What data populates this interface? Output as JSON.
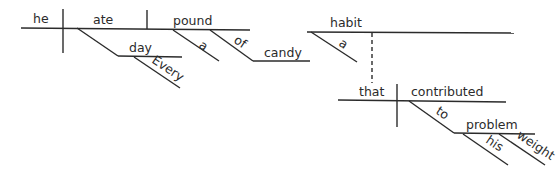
{
  "diagram": {
    "type": "sentence-diagram",
    "sentence_words": {
      "subject": "he",
      "verb": "ate",
      "object": "pound",
      "adverbial_noun": "day",
      "adverbial_modifier": "Every",
      "object_article": "a",
      "preposition": "of",
      "prep_object": "candy",
      "appositive_head": "habit",
      "appositive_article": "a",
      "relative_pronoun": "that",
      "relative_verb": "contributed",
      "relative_preposition": "to",
      "relative_prep_object": "problem",
      "possessive": "his",
      "noun_modifier": "weight"
    }
  }
}
